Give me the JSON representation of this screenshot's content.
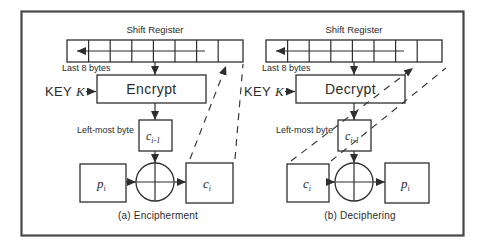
{
  "figure": {
    "colors": {
      "ink": "#2e2e2e",
      "frame": "#474747",
      "background": "#ffffff"
    },
    "panels": {
      "a": {
        "shift_register_label": "Shift Register",
        "last_bytes_label": "Last 8 bytes",
        "key_word": "KEY",
        "key_var": "K",
        "cipher_label": "Encrypt",
        "leftmost_label": "Left-most byte",
        "feedback_var": "c",
        "feedback_sub": "i-1",
        "input_var": "p",
        "input_sub": "i",
        "output_var": "c",
        "output_sub": "i",
        "caption": "(a) Encipherment"
      },
      "b": {
        "shift_register_label": "Shift Register",
        "last_bytes_label": "Last 8 bytes",
        "key_word": "KEY",
        "key_var": "K",
        "cipher_label": "Decrypt",
        "leftmost_label": "Left-most byte",
        "feedback_var": "c",
        "feedback_sub": "i-1",
        "input_var": "c",
        "input_sub": "i",
        "output_var": "p",
        "output_sub": "i",
        "caption": "(b) Deciphering"
      }
    }
  }
}
